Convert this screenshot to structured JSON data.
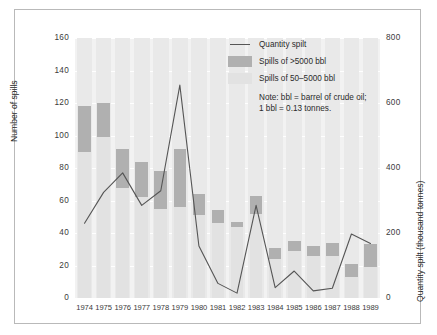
{
  "chart_data": {
    "type": "bar",
    "title": "",
    "xlabel": "",
    "ylabel": "Number of spills",
    "ylabel_right": "Quantity spilt (thousand tonnes)",
    "ylim": [
      0,
      160
    ],
    "ylim_right": [
      0,
      800
    ],
    "yticks": [
      "160",
      "140",
      "120",
      "100",
      "80",
      "60",
      "40",
      "20",
      "0"
    ],
    "ytick_values": [
      160,
      140,
      120,
      100,
      80,
      60,
      40,
      20,
      0
    ],
    "yticks_right": [
      "800",
      "600",
      "400",
      "200",
      "0"
    ],
    "ytick_values_right": [
      800,
      600,
      400,
      200,
      0
    ],
    "grid": true,
    "legend_position": "top-right",
    "categories": [
      "1974",
      "1975",
      "1976",
      "1977",
      "1978",
      "1979",
      "1980",
      "1981",
      "1982",
      "1983",
      "1984",
      "1985",
      "1986",
      "1987",
      "1988",
      "1989"
    ],
    "series": [
      {
        "name": "Spills of 50-5000 bbl",
        "type": "bar",
        "color": "#e2e2e2",
        "values": [
          90,
          99,
          68,
          62,
          55,
          56,
          51,
          46,
          44,
          52,
          24,
          29,
          26,
          26,
          13,
          19
        ]
      },
      {
        "name": "Spills of >5000 bbl",
        "type": "bar",
        "color": "#b0b0b0",
        "stacked_top": [
          118,
          120,
          92,
          84,
          78,
          92,
          64,
          54,
          47,
          63,
          31,
          35,
          32,
          34,
          21,
          33
        ]
      },
      {
        "name": "Quantity spilt",
        "type": "line",
        "color": "#555555",
        "axis": "right",
        "values": [
          230,
          325,
          385,
          285,
          330,
          655,
          160,
          45,
          15,
          285,
          32,
          83,
          22,
          30,
          197,
          168
        ]
      }
    ]
  },
  "legend": {
    "items": [
      {
        "mark": "line",
        "label": "Quantity spilt"
      },
      {
        "mark": "swatch-dark",
        "label": "Spills of >5000 bbl"
      },
      {
        "mark": "swatch-light",
        "label": "Spills of 50–5000 bbl"
      }
    ],
    "note": "Note: bbl = barrel of crude oil; 1 bbl = 0.13 tonnes."
  }
}
